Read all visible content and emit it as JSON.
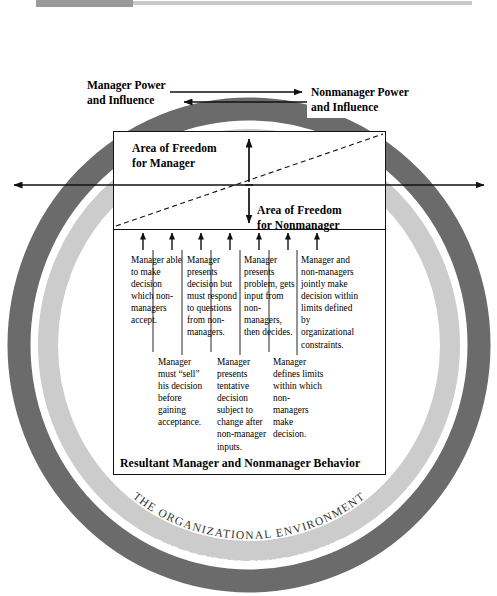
{
  "figure": {
    "colors": {
      "outer_ring": "#6b6b6b",
      "inner_ring": "#cccccc",
      "background": "#ffffff",
      "line": "#111111",
      "top_rule_dark": "#9a9a9a",
      "top_rule_light": "#c9c9c9"
    }
  },
  "power": {
    "manager": "Manager Power\nand Influence",
    "manager_line1": "Manager Power",
    "manager_line2": "and Influence",
    "nonmanager_line1": "Nonmanager Power",
    "nonmanager_line2": "and Influence"
  },
  "freedom": {
    "manager_line1": "Area of Freedom",
    "manager_line2": "for Manager",
    "nonmanager_line1": "Area of Freedom",
    "nonmanager_line2": "for Nonmanager"
  },
  "continuum": {
    "caption": "Resultant Manager and Nonmanager Behavior",
    "tick_count": 7,
    "top_row": [
      "Manager able to make decision which non-managers accept.",
      "Manager presents decision but must respond to questions from non-managers.",
      "Manager presents problem, gets input from non-managers, then decides.",
      "Manager and non-managers jointly make decision within limits defined by organizational constraints."
    ],
    "bottom_row": [
      "Manager must “sell” his decision before gaining acceptance.",
      "Manager presents tentative decision subject to change after non-manager inputs.",
      "Manager defines limits within which non-managers make decision."
    ]
  },
  "rings": {
    "organizational": "THE ORGANIZATIONAL ENVIRONMENT",
    "societal": "THE SOCIETAL ENVIRONMENT"
  }
}
